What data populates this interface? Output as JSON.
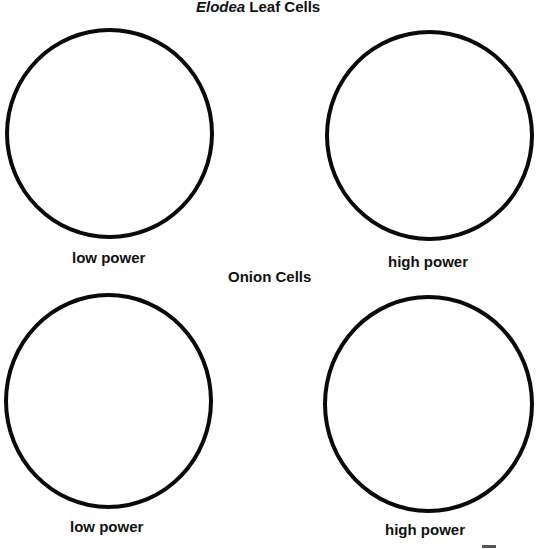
{
  "sections": [
    {
      "title_italic": "Elodea",
      "title_rest": " Leaf Cells",
      "left_label": "low power",
      "right_label": "high power"
    },
    {
      "title": "Onion Cells",
      "left_label": "low power",
      "right_label": "high power"
    }
  ]
}
